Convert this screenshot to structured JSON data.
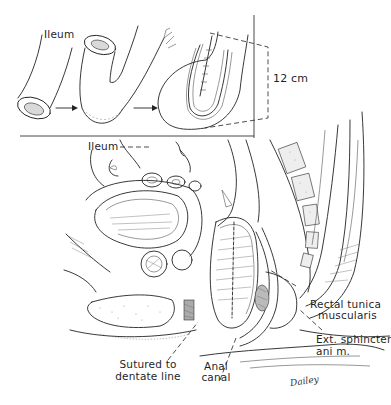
{
  "figure": {
    "type": "surgical illustration",
    "inset": {
      "steps": 3,
      "labels": {
        "ileum": "Ileum",
        "length": "12 cm"
      }
    },
    "main": {
      "labels": {
        "ileum": "Ileum",
        "rectal_tunica_line1": "Rectal tunica",
        "rectal_tunica_line2": "muscularis",
        "ext_sphincter_line1": "Ext. sphincter",
        "ext_sphincter_line2": "ani m.",
        "sutured_line1": "Sutured to",
        "sutured_line2": "dentate line",
        "anal_canal_line1": "Anal",
        "anal_canal_line2": "canal"
      },
      "signature": "Dailey"
    }
  }
}
